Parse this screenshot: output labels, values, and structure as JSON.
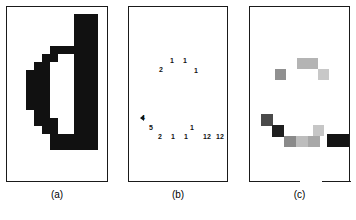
{
  "figure": {
    "width": 356,
    "height": 220,
    "background": "#ffffff",
    "ink": "#111111"
  },
  "panels": [
    {
      "id": "a",
      "caption": "(a)",
      "x": 6,
      "y": 6,
      "width": 102,
      "height": 176,
      "bottom_rule_gap": null,
      "description": "binary-region-shape"
    },
    {
      "id": "b",
      "caption": "(b)",
      "x": 128,
      "y": 6,
      "width": 100,
      "height": 176,
      "bottom_rule_gap": null,
      "description": "labelled-chain-code-numbers"
    },
    {
      "id": "c",
      "caption": "(c)",
      "x": 249,
      "y": 6,
      "width": 101,
      "height": 176,
      "bottom_rule_gap": {
        "start": 50,
        "end": 72
      },
      "description": "grayscale-weighted-cells"
    }
  ],
  "panel_a": {
    "cell": 8,
    "origin_x": 18,
    "origin_y": 14,
    "fill": "#111111",
    "blocks": [
      {
        "col": 7,
        "row": 0,
        "cols": 3,
        "rows": 2
      },
      {
        "col": 7,
        "row": 2,
        "cols": 3,
        "rows": 2
      },
      {
        "col": 4,
        "row": 4,
        "cols": 6,
        "rows": 1
      },
      {
        "col": 3,
        "row": 5,
        "cols": 2,
        "rows": 1
      },
      {
        "col": 7,
        "row": 5,
        "cols": 3,
        "rows": 1
      },
      {
        "col": 2,
        "row": 6,
        "cols": 2,
        "rows": 1
      },
      {
        "col": 7,
        "row": 6,
        "cols": 3,
        "rows": 1
      },
      {
        "col": 1,
        "row": 7,
        "cols": 3,
        "rows": 1
      },
      {
        "col": 7,
        "row": 7,
        "cols": 3,
        "rows": 1
      },
      {
        "col": 1,
        "row": 8,
        "cols": 3,
        "rows": 1
      },
      {
        "col": 7,
        "row": 8,
        "cols": 3,
        "rows": 1
      },
      {
        "col": 1,
        "row": 9,
        "cols": 3,
        "rows": 1
      },
      {
        "col": 7,
        "row": 9,
        "cols": 3,
        "rows": 1
      },
      {
        "col": 1,
        "row": 10,
        "cols": 3,
        "rows": 1
      },
      {
        "col": 7,
        "row": 10,
        "cols": 3,
        "rows": 1
      },
      {
        "col": 1,
        "row": 11,
        "cols": 3,
        "rows": 1
      },
      {
        "col": 7,
        "row": 11,
        "cols": 3,
        "rows": 1
      },
      {
        "col": 2,
        "row": 12,
        "cols": 2,
        "rows": 1
      },
      {
        "col": 7,
        "row": 12,
        "cols": 3,
        "rows": 1
      },
      {
        "col": 2,
        "row": 13,
        "cols": 3,
        "rows": 1
      },
      {
        "col": 7,
        "row": 13,
        "cols": 3,
        "rows": 1
      },
      {
        "col": 3,
        "row": 14,
        "cols": 2,
        "rows": 1
      },
      {
        "col": 7,
        "row": 14,
        "cols": 3,
        "rows": 1
      },
      {
        "col": 4,
        "row": 15,
        "cols": 6,
        "rows": 1
      },
      {
        "col": 4,
        "row": 16,
        "cols": 6,
        "rows": 1
      }
    ]
  },
  "panel_b": {
    "labels": [
      {
        "text": "1",
        "x": 172,
        "y": 60
      },
      {
        "text": "1",
        "x": 185,
        "y": 60
      },
      {
        "text": "2",
        "x": 161,
        "y": 69
      },
      {
        "text": "1",
        "x": 196,
        "y": 70
      },
      {
        "text": "4",
        "x": 143,
        "y": 117
      },
      {
        "text": "5",
        "x": 151,
        "y": 127
      },
      {
        "text": "1",
        "x": 192,
        "y": 127
      },
      {
        "text": "2",
        "x": 160,
        "y": 136
      },
      {
        "text": "1",
        "x": 173,
        "y": 136
      },
      {
        "text": "1",
        "x": 186,
        "y": 136
      },
      {
        "text": "12",
        "x": 207,
        "y": 136
      },
      {
        "text": "12",
        "x": 220,
        "y": 136
      }
    ],
    "markers": [
      {
        "kind": "left-pointing-triangle",
        "x": 142,
        "y": 118
      }
    ]
  },
  "panel_c": {
    "cell": 11,
    "cells": [
      {
        "x": 297,
        "y": 58,
        "w": 21,
        "h": 11,
        "gray": "#b4b4b4"
      },
      {
        "x": 275,
        "y": 69,
        "w": 11,
        "h": 11,
        "gray": "#909090"
      },
      {
        "x": 286,
        "y": 69,
        "w": 11,
        "h": 11,
        "gray": "#ffffff"
      },
      {
        "x": 318,
        "y": 69,
        "w": 11,
        "h": 11,
        "gray": "#c8c8c8"
      },
      {
        "x": 261,
        "y": 114,
        "w": 12,
        "h": 12,
        "gray": "#4a4a4a"
      },
      {
        "x": 272,
        "y": 125,
        "w": 12,
        "h": 12,
        "gray": "#1f1f1f"
      },
      {
        "x": 284,
        "y": 136,
        "w": 12,
        "h": 11,
        "gray": "#8a8a8a"
      },
      {
        "x": 296,
        "y": 136,
        "w": 12,
        "h": 11,
        "gray": "#bdbdbd"
      },
      {
        "x": 308,
        "y": 136,
        "w": 12,
        "h": 11,
        "gray": "#a8a8a8"
      },
      {
        "x": 313,
        "y": 125,
        "w": 11,
        "h": 11,
        "gray": "#c6c6c6"
      },
      {
        "x": 327,
        "y": 134,
        "w": 22,
        "h": 13,
        "gray": "#141414"
      }
    ]
  }
}
